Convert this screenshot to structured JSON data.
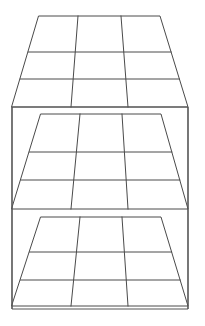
{
  "canvas": {
    "width": 205,
    "height": 326,
    "background_color": "#ffffff"
  },
  "drawing": {
    "title": "Three-tier shelving unit perspective line drawing",
    "subject": "shelf-rack",
    "style": "black-and-white line art",
    "line_color": "#4a4a4a",
    "frame_color": "#555555",
    "fill_color": "#ffffff",
    "line_width": 1,
    "perspective": "one-point, viewed from above-front",
    "shelf_count": 3,
    "grid_columns": 3,
    "grid_rows": 3
  },
  "frame": {
    "name": "outer-frame",
    "left": 12,
    "right": 188,
    "top": 107,
    "bottom": 309
  },
  "shelves": [
    {
      "id": "top-shelf",
      "label": "Top shelf",
      "back_left_x": 39,
      "back_right_x": 160,
      "back_y": 16,
      "front_left_x": 12,
      "front_right_x": 188,
      "front_y": 107,
      "back_div_x": [
        78,
        121
      ],
      "front_div_x": [
        71,
        128
      ],
      "row_y_left": [
        52,
        79
      ],
      "row_y_right": [
        52,
        79
      ],
      "row_y_back_ratio": [
        0.4,
        0.7
      ]
    },
    {
      "id": "middle-shelf",
      "label": "Middle shelf",
      "back_left_x": 41,
      "back_right_x": 161,
      "back_y": 114,
      "front_left_x": 12,
      "front_right_x": 188,
      "front_y": 209,
      "back_div_x": [
        80,
        122
      ],
      "front_div_x": [
        71,
        128
      ],
      "row_y_left": [
        152,
        180
      ],
      "row_y_right": [
        152,
        180
      ],
      "row_y_back_ratio": [
        0.4,
        0.7
      ]
    },
    {
      "id": "bottom-shelf",
      "label": "Bottom shelf",
      "back_left_x": 41,
      "back_right_x": 161,
      "back_y": 217,
      "front_left_x": 12,
      "front_right_x": 188,
      "front_y": 306,
      "back_div_x": [
        80,
        122
      ],
      "front_div_x": [
        71,
        128
      ],
      "row_y_left": [
        252,
        280
      ],
      "row_y_right": [
        252,
        280
      ],
      "row_y_back_ratio": [
        0.4,
        0.7
      ]
    }
  ],
  "side_rails": [
    {
      "id": "left-rail-upper",
      "x": 12,
      "y_top": 107,
      "y_bottom": 209
    },
    {
      "id": "right-rail-upper",
      "x": 188,
      "y_top": 107,
      "y_bottom": 209
    },
    {
      "id": "left-rail-lower",
      "x": 12,
      "y_top": 209,
      "y_bottom": 309
    },
    {
      "id": "right-rail-lower",
      "x": 188,
      "y_top": 209,
      "y_bottom": 309
    }
  ]
}
